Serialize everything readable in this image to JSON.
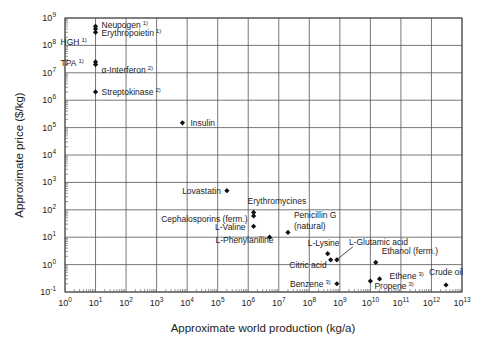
{
  "chart_data": {
    "type": "scatter",
    "title": "",
    "xlabel": "Approximate world production (kg/a)",
    "ylabel": "Approximate price ($/kg)",
    "xscale": "log",
    "yscale": "log",
    "xlim": [
      1,
      10000000000000.0
    ],
    "ylim": [
      0.1,
      1000000000.0
    ],
    "grid": true,
    "legend": "none",
    "x_ticks": [
      {
        "mant": "10",
        "exp": "0"
      },
      {
        "mant": "10",
        "exp": "1"
      },
      {
        "mant": "10",
        "exp": "2"
      },
      {
        "mant": "10",
        "exp": "3"
      },
      {
        "mant": "10",
        "exp": "4"
      },
      {
        "mant": "10",
        "exp": "5"
      },
      {
        "mant": "10",
        "exp": "6"
      },
      {
        "mant": "10",
        "exp": "7"
      },
      {
        "mant": "10",
        "exp": "8"
      },
      {
        "mant": "10",
        "exp": "9"
      },
      {
        "mant": "10",
        "exp": "10"
      },
      {
        "mant": "10",
        "exp": "11"
      },
      {
        "mant": "10",
        "exp": "12"
      },
      {
        "mant": "10",
        "exp": "13"
      }
    ],
    "y_ticks": [
      {
        "mant": "10",
        "exp": "-1"
      },
      {
        "mant": "10",
        "exp": "0"
      },
      {
        "mant": "10",
        "exp": "1"
      },
      {
        "mant": "10",
        "exp": "2"
      },
      {
        "mant": "10",
        "exp": "3"
      },
      {
        "mant": "10",
        "exp": "4"
      },
      {
        "mant": "10",
        "exp": "5"
      },
      {
        "mant": "10",
        "exp": "6"
      },
      {
        "mant": "10",
        "exp": "7"
      },
      {
        "mant": "10",
        "exp": "8"
      },
      {
        "mant": "10",
        "exp": "9"
      }
    ],
    "points": [
      {
        "name": "Neupogen",
        "note": "1)",
        "x": 10,
        "y": 500000000.0
      },
      {
        "name": "Erythropoietin",
        "note": "1)",
        "x": 10,
        "y": 400000000.0
      },
      {
        "name": "HGH",
        "note": "1)",
        "x": 10,
        "y": 300000000.0
      },
      {
        "name": "TPA",
        "note": "1)",
        "x": 10,
        "y": 25000000.0
      },
      {
        "name": "α-Interferon",
        "note": "2)",
        "x": 10,
        "y": 20000000.0
      },
      {
        "name": "Streptokinase",
        "note": "2)",
        "x": 10,
        "y": 2000000.0
      },
      {
        "name": "Insulin",
        "note": "",
        "x": 7000,
        "y": 150000.0
      },
      {
        "name": "Lovastatin",
        "note": "",
        "x": 200000,
        "y": 500
      },
      {
        "name": "Erythromycines",
        "note": "",
        "x": 1500000.0,
        "y": 80
      },
      {
        "name": "Cephalosporins (ferm.)",
        "note": "",
        "x": 1500000.0,
        "y": 60
      },
      {
        "name": "L-Valine",
        "note": "",
        "x": 1500000.0,
        "y": 25
      },
      {
        "name": "L-Phenylaniline",
        "note": "",
        "x": 5000000.0,
        "y": 10
      },
      {
        "name": "Penicillin G (natural)",
        "note": "",
        "x": 20000000.0,
        "y": 15
      },
      {
        "name": "L-Lysine",
        "note": "",
        "x": 400000000.0,
        "y": 2.5
      },
      {
        "name": "Citric acid",
        "note": "",
        "x": 500000000.0,
        "y": 1.5
      },
      {
        "name": "L-Glutamic acid",
        "note": "",
        "x": 800000000.0,
        "y": 1.5
      },
      {
        "name": "Benzene",
        "note": "3)",
        "x": 800000000.0,
        "y": 0.2
      },
      {
        "name": "Ethanol (ferm.)",
        "note": "",
        "x": 15000000000.0,
        "y": 1.2
      },
      {
        "name": "Propene",
        "note": "3)",
        "x": 10000000000.0,
        "y": 0.25
      },
      {
        "name": "Ethene",
        "note": "3)",
        "x": 20000000000.0,
        "y": 0.3
      },
      {
        "name": "Crude oil",
        "note": "",
        "x": 3000000000000.0,
        "y": 0.18
      }
    ]
  }
}
